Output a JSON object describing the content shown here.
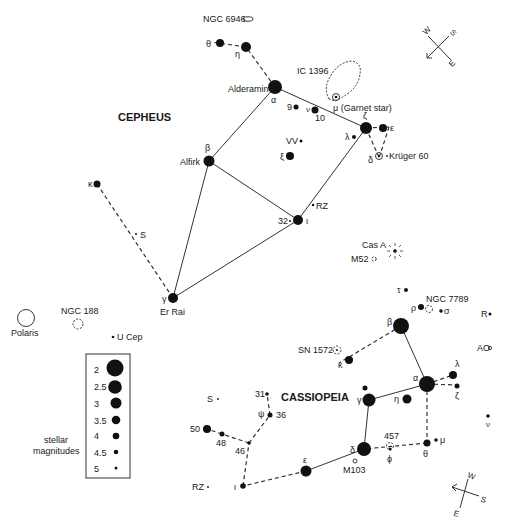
{
  "constellations": {
    "cepheus": {
      "title": "CEPHEUS"
    },
    "cassiopeia": {
      "title": "CASSIOPEIA"
    }
  },
  "cepheus_labels": {
    "ngc6946": "NGC 6946",
    "theta": "θ",
    "eta": "η",
    "alderamin": "Alderamin",
    "alpha": "α",
    "ic1396": "IC 1396",
    "mu": "μ (Garnet star)",
    "nine": "9",
    "nu": "ν",
    "ten": "10",
    "zeta": "ζ",
    "epsilon": "ε",
    "lambda": "λ",
    "delta": "δ",
    "kruger": "Krüger 60",
    "vv": "VV",
    "xi": "ξ",
    "beta": "β",
    "alfirk": "Alfirk",
    "kappa": "κ",
    "s": "S",
    "rz": "RZ",
    "thirtytwo": "32",
    "iota": "ι",
    "gamma": "γ",
    "errai": "Er Rai"
  },
  "misc_labels": {
    "polaris": "Polaris",
    "ngc188": "NGC 188",
    "ucep": "U Cep",
    "casa": "Cas A",
    "m52": "M52"
  },
  "cassiopeia_labels": {
    "tau": "τ",
    "rho": "ρ",
    "ngc7789": "NGC 7789",
    "sigma": "σ",
    "r": "R",
    "ao": "AO",
    "beta": "β",
    "sn1572": "SN 1572",
    "kappa": "κ",
    "alpha": "α",
    "lambda": "λ",
    "zeta": "ζ",
    "gamma": "γ",
    "eta": "η",
    "nu": "ν",
    "s": "S",
    "thirtyone": "31",
    "psi": "ψ",
    "thirtysix": "36",
    "fifty": "50",
    "fortyeight": "48",
    "fortysix": "46",
    "four57": "457",
    "mu": "μ",
    "delta": "δ",
    "phi": "ϕ",
    "theta": "θ",
    "m103": "M103",
    "epsilon": "ε",
    "rz": "RZ",
    "iota": "ι"
  },
  "compass_top": {
    "w": "W",
    "s": "S",
    "e": "E"
  },
  "compass_bottom": {
    "w": "W",
    "s": "S",
    "e": "E"
  },
  "legend": {
    "title_line1": "stellar",
    "title_line2": "magnitudes",
    "magnitudes": [
      "2",
      "2.5",
      "3",
      "3.5",
      "4",
      "4.5",
      "5"
    ]
  }
}
